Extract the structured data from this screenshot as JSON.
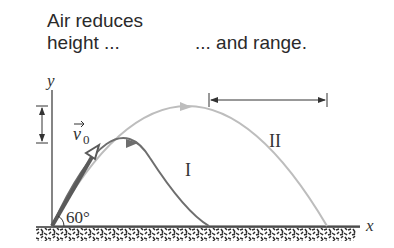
{
  "captions": {
    "left_line1": "Air reduces",
    "left_line2": "height ...",
    "right": "... and range."
  },
  "axes": {
    "x_label": "x",
    "y_label": "y"
  },
  "launch": {
    "velocity_label": "v",
    "velocity_subscript": "0",
    "angle_label": "60°"
  },
  "trajectories": [
    {
      "id": "I",
      "label": "I",
      "description": "with air resistance",
      "color": "#6e6e6e"
    },
    {
      "id": "II",
      "label": "II",
      "description": "without air resistance",
      "color": "#bdbdbd"
    }
  ],
  "annotations": {
    "height_difference_arrow": "vertical double arrow showing reduced height",
    "range_difference_arrow": "horizontal double arrow showing reduced range"
  },
  "colors": {
    "text": "#2a2a2a",
    "axis": "#333333",
    "trajectory_I": "#6e6e6e",
    "trajectory_II": "#bdbdbd",
    "ground": "#3a3a3a"
  }
}
